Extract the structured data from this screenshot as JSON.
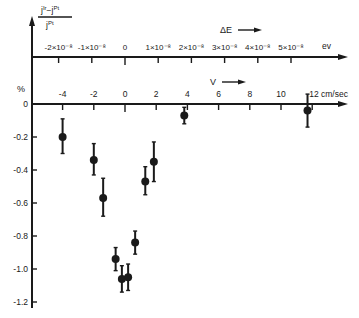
{
  "chart_data": {
    "type": "scatter",
    "title": "",
    "ylabel": {
      "numerator": "j^Ir − j^Pt",
      "numerator_base1": "j",
      "numerator_sup1": "Ir",
      "numerator_mid": "−j",
      "numerator_sup2": "Pt",
      "denominator_base": "j",
      "denominator_sup": "Pt",
      "unit": "%"
    },
    "xlabel_bottom": "V",
    "xlabel_bottom_unit": "cm/sec",
    "xlabel_top": "ΔE",
    "xlabel_top_unit": "ev",
    "xlim_bottom": [
      -5.5,
      14
    ],
    "ylim": [
      -1.25,
      0
    ],
    "bottom_axis_ticks": [
      -4,
      -2,
      0,
      2,
      4,
      6,
      8,
      10,
      12
    ],
    "bottom_axis_tick_labels": [
      "-4",
      "-2",
      "0",
      "2",
      "4",
      "6",
      "8",
      "10",
      "12 cm/sec"
    ],
    "top_axis_ticks": [
      -2e-08,
      -1e-08,
      0,
      1e-08,
      2e-08,
      3e-08,
      4e-08,
      5e-08
    ],
    "top_axis_tick_labels": [
      "-2×10⁻⁸",
      "-1×10⁻⁸",
      "0",
      "1×10⁻⁸",
      "2×10⁻⁸",
      "3×10⁻⁸",
      "4×10⁻⁸",
      "5×10⁻⁸"
    ],
    "y_ticks": [
      0,
      -0.2,
      -0.4,
      -0.6,
      -0.8,
      -1.0,
      -1.2
    ],
    "y_tick_labels": [
      "0",
      "-0.2",
      "-0.4",
      "-0.6",
      "-0.8",
      "-1.0",
      "-1.2"
    ],
    "grid": false,
    "legend": null,
    "series": [
      {
        "name": "measurements",
        "points": [
          {
            "x": -4.0,
            "y": -0.2,
            "err_low": -0.3,
            "err_high": -0.09
          },
          {
            "x": -2.0,
            "y": -0.34,
            "err_low": -0.43,
            "err_high": -0.24
          },
          {
            "x": -1.4,
            "y": -0.57,
            "err_low": -0.68,
            "err_high": -0.45
          },
          {
            "x": -0.6,
            "y": -0.94,
            "err_low": -1.01,
            "err_high": -0.87
          },
          {
            "x": -0.2,
            "y": -1.06,
            "err_low": -1.14,
            "err_high": -0.98
          },
          {
            "x": 0.2,
            "y": -1.05,
            "err_low": -1.13,
            "err_high": -0.97
          },
          {
            "x": 0.65,
            "y": -0.84,
            "err_low": -0.91,
            "err_high": -0.77
          },
          {
            "x": 1.3,
            "y": -0.47,
            "err_low": -0.55,
            "err_high": -0.38
          },
          {
            "x": 1.85,
            "y": -0.35,
            "err_low": -0.47,
            "err_high": -0.23
          },
          {
            "x": 3.8,
            "y": -0.07,
            "err_low": -0.12,
            "err_high": -0.02
          },
          {
            "x": 11.7,
            "y": -0.04,
            "err_low": -0.14,
            "err_high": 0.06
          }
        ]
      }
    ]
  }
}
